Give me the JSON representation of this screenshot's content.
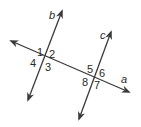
{
  "diagram": {
    "lines": {
      "a": {
        "label": "a"
      },
      "b": {
        "label": "b"
      },
      "c": {
        "label": "c"
      }
    },
    "angles_at_b": [
      "1",
      "2",
      "3",
      "4"
    ],
    "angles_at_c": [
      "5",
      "6",
      "7",
      "8"
    ],
    "line_color": "#3a3a3a"
  }
}
